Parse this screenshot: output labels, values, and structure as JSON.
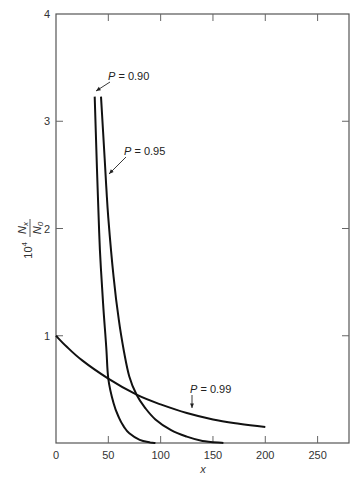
{
  "chart_data": {
    "type": "line",
    "title": "",
    "xlabel": "x",
    "ylabel": "10^4 N_x / N_0",
    "ylabel_parts": {
      "prefix": "10",
      "exp": "4",
      "num": "N",
      "num_sub": "x",
      "den": "N",
      "den_sub": "0"
    },
    "xlim": [
      0,
      280
    ],
    "ylim": [
      0,
      4
    ],
    "xticks": [
      0,
      50,
      100,
      150,
      200,
      250
    ],
    "xtick_labels": [
      "0",
      "50",
      "100",
      "150",
      "200",
      "250"
    ],
    "yticks": [
      1,
      2,
      3,
      4
    ],
    "ytick_labels": [
      "1",
      "2",
      "3",
      "4"
    ],
    "grid": false,
    "legend": "none (inline annotations)",
    "series": [
      {
        "name": "P = 0.90",
        "label": "P = 0.90",
        "x": [
          37,
          38,
          40,
          42,
          45,
          48,
          50,
          55,
          60,
          65,
          70,
          80,
          90,
          95
        ],
        "y": [
          3.23,
          2.9,
          2.3,
          1.8,
          1.3,
          0.9,
          0.6,
          0.37,
          0.24,
          0.15,
          0.09,
          0.03,
          0.005,
          0.0
        ]
      },
      {
        "name": "P = 0.95",
        "label": "P = 0.95",
        "x": [
          43,
          45,
          48,
          50,
          55,
          60,
          65,
          70,
          77,
          85,
          95,
          110,
          125,
          140,
          160
        ],
        "y": [
          3.23,
          2.9,
          2.4,
          2.1,
          1.55,
          1.15,
          0.85,
          0.62,
          0.45,
          0.33,
          0.22,
          0.12,
          0.06,
          0.02,
          0.0
        ]
      },
      {
        "name": "P = 0.99",
        "label": "P = 0.99",
        "x": [
          0,
          10,
          25,
          50,
          77,
          100,
          125,
          150,
          175,
          200
        ],
        "y": [
          1.0,
          0.9,
          0.77,
          0.6,
          0.45,
          0.36,
          0.28,
          0.22,
          0.18,
          0.15
        ]
      }
    ],
    "annotations": [
      {
        "text": "P = 0.90",
        "points_to": [
          37,
          3.23
        ]
      },
      {
        "text": "P = 0.95",
        "points_to": [
          46,
          2.7
        ]
      },
      {
        "text": "P = 0.99",
        "points_to": [
          128,
          0.27
        ]
      }
    ]
  }
}
